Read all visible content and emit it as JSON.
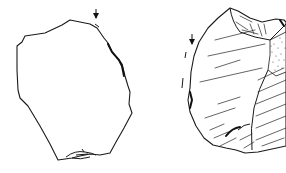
{
  "figure": {
    "description": "Archaeological line drawing of a flaked stone artifact shown in two views",
    "views": [
      {
        "id": "ventral",
        "label": "",
        "position": "left"
      },
      {
        "id": "dorsal",
        "label": "",
        "position": "right"
      }
    ],
    "annotations": [
      {
        "type": "arrow",
        "view": "ventral",
        "meaning": "striking direction"
      },
      {
        "type": "arrow",
        "view": "dorsal",
        "meaning": "striking direction"
      }
    ],
    "colors": {
      "ink": "#1a1a1a",
      "paper": "#ffffff"
    }
  }
}
